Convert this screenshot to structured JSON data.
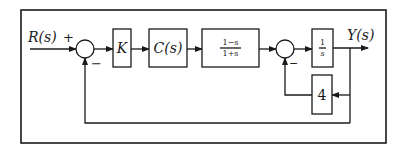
{
  "diagram": {
    "type": "control-block-diagram",
    "input": {
      "label": "R(s)"
    },
    "output": {
      "label": "Y(s)"
    },
    "summing_junctions": [
      {
        "id": "sum1",
        "signs": {
          "main_input": "+",
          "feedback": "−"
        }
      },
      {
        "id": "sum2",
        "signs": {
          "main_input": "",
          "feedback": "−"
        }
      }
    ],
    "blocks": [
      {
        "id": "gain-k",
        "label": "K"
      },
      {
        "id": "controller",
        "label": "C(s)"
      },
      {
        "id": "plant-allpass",
        "numerator": "1−s",
        "denominator": "1+s"
      },
      {
        "id": "integrator",
        "numerator": "1",
        "denominator": "s"
      },
      {
        "id": "inner-feedback-gain",
        "label": "4"
      }
    ],
    "signals": [
      "R(s) → sum1 (+)",
      "sum1 → K",
      "K → C(s)",
      "C(s) → (1−s)/(1+s)",
      "(1−s)/(1+s) → sum2",
      "sum2 → 1/s",
      "1/s → Y(s)",
      "Y(s) → 4 → sum2 (−)",
      "Y(s) → sum1 (−)"
    ]
  },
  "colors": {
    "line": "#1a1a1a",
    "background": "#ffffff"
  }
}
